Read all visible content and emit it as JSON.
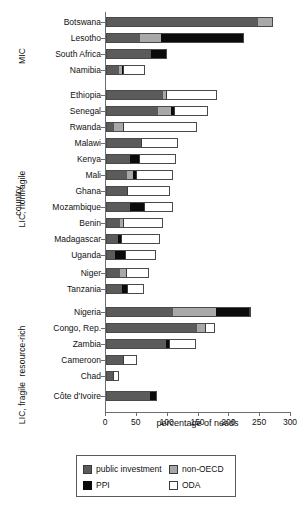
{
  "chart": {
    "type": "bar_stacked_horizontal",
    "xlabel": "percentage of needs",
    "ylabel": "country",
    "xlim": [
      0,
      300
    ],
    "xticks": [
      0,
      50,
      100,
      150,
      200,
      250,
      300
    ],
    "xticklabels": [
      "0",
      "50",
      "100",
      "150",
      "200",
      "250",
      "300"
    ],
    "grid": false,
    "orientation": "horizontal",
    "stacked": true
  },
  "legend": {
    "position": "bottom",
    "entries": [
      {
        "key": "public_investment",
        "label": "public investment",
        "color": "#5b5b5b"
      },
      {
        "key": "non_oecd",
        "label": "non-OECD",
        "color": "#a8a8a8"
      },
      {
        "key": "ppi",
        "label": "PPI",
        "color": "#0b0b0b"
      },
      {
        "key": "oda",
        "label": "ODA",
        "color": "#ffffff"
      }
    ]
  },
  "groups": [
    {
      "key": "mic",
      "label": "MIC"
    },
    {
      "key": "lic_nonfragile",
      "label": "LIC, nonfragile"
    },
    {
      "key": "resource_rich",
      "label": "resource-rich"
    },
    {
      "key": "lic_fragile",
      "label": "LIC, fragile"
    }
  ],
  "chart_data": {
    "type": "bar",
    "title": "",
    "subtitle": "",
    "xlabel": "percentage of needs",
    "ylabel": "country",
    "xlim": [
      0,
      300
    ],
    "ylim": null,
    "grid": false,
    "legend_position": "bottom",
    "stacked": true,
    "orientation": "horizontal",
    "series": [
      {
        "name": "public investment",
        "color": "#5b5b5b",
        "values": [
          246,
          55,
          73,
          21,
          92,
          84,
          13,
          57,
          39,
          34,
          34,
          39,
          23,
          19,
          15,
          23,
          26,
          109,
          147,
          97,
          28,
          11,
          71
        ]
      },
      {
        "name": "non-OECD",
        "color": "#a8a8a8",
        "values": [
          24,
          34,
          0,
          5,
          5,
          21,
          15,
          0,
          0,
          10,
          0,
          0,
          4,
          0,
          0,
          10,
          0,
          70,
          13,
          0,
          0,
          0,
          0
        ]
      },
      {
        "name": "PPI",
        "color": "#0b0b0b",
        "values": [
          0,
          134,
          26,
          2,
          0,
          6,
          0,
          0,
          15,
          5,
          0,
          23,
          0,
          6,
          16,
          0,
          8,
          53,
          0,
          5,
          0,
          0,
          11
        ]
      },
      {
        "name": "ODA",
        "color": "#ffffff",
        "values": [
          0,
          0,
          0,
          36,
          83,
          55,
          120,
          60,
          60,
          60,
          70,
          47,
          65,
          62,
          50,
          36,
          28,
          3,
          16,
          44,
          23,
          10,
          0
        ]
      }
    ],
    "categories": [
      "Botswana",
      "Lesotho",
      "South Africa",
      "Namibia",
      "Ethiopia",
      "Senegal",
      "Rwanda",
      "Malawi",
      "Kenya",
      "Mali",
      "Ghana",
      "Mozambique",
      "Benin",
      "Madagascar",
      "Uganda",
      "Niger",
      "Tanzania",
      "Nigeria",
      "Congo, Rep.",
      "Zambia",
      "Cameroon",
      "Chad",
      "Côte d'Ivoire"
    ],
    "category_groups": [
      "MIC",
      "MIC",
      "MIC",
      "MIC",
      "LIC, nonfragile",
      "LIC, nonfragile",
      "LIC, nonfragile",
      "LIC, nonfragile",
      "LIC, nonfragile",
      "LIC, nonfragile",
      "LIC, nonfragile",
      "LIC, nonfragile",
      "LIC, nonfragile",
      "LIC, nonfragile",
      "LIC, nonfragile",
      "LIC, nonfragile",
      "LIC, nonfragile",
      "resource-rich",
      "resource-rich",
      "resource-rich",
      "resource-rich",
      "resource-rich",
      "LIC, fragile"
    ],
    "totals": [
      270,
      223,
      99,
      64,
      180,
      166,
      148,
      117,
      114,
      109,
      104,
      109,
      92,
      87,
      81,
      69,
      62,
      235,
      176,
      146,
      51,
      21,
      82
    ]
  },
  "bars": [
    {
      "category": "Botswana",
      "y": 17,
      "segments": [
        {
          "k": "public_investment",
          "v": 246
        },
        {
          "k": "non_oecd",
          "v": 24
        }
      ]
    },
    {
      "category": "Lesotho",
      "y": 33,
      "segments": [
        {
          "k": "public_investment",
          "v": 55
        },
        {
          "k": "non_oecd",
          "v": 34
        },
        {
          "k": "ppi",
          "v": 134
        }
      ]
    },
    {
      "category": "South Africa",
      "y": 49,
      "segments": [
        {
          "k": "public_investment",
          "v": 73
        },
        {
          "k": "ppi",
          "v": 26
        }
      ]
    },
    {
      "category": "Namibia",
      "y": 65,
      "segments": [
        {
          "k": "public_investment",
          "v": 21
        },
        {
          "k": "non_oecd",
          "v": 5
        },
        {
          "k": "ppi",
          "v": 2
        },
        {
          "k": "oda",
          "v": 36
        }
      ]
    },
    {
      "category": "Ethiopia",
      "y": 90,
      "segments": [
        {
          "k": "public_investment",
          "v": 92
        },
        {
          "k": "non_oecd",
          "v": 5
        },
        {
          "k": "oda",
          "v": 83
        }
      ]
    },
    {
      "category": "Senegal",
      "y": 106,
      "segments": [
        {
          "k": "public_investment",
          "v": 84
        },
        {
          "k": "non_oecd",
          "v": 21
        },
        {
          "k": "ppi",
          "v": 6
        },
        {
          "k": "oda",
          "v": 55
        }
      ]
    },
    {
      "category": "Rwanda",
      "y": 122,
      "segments": [
        {
          "k": "public_investment",
          "v": 13
        },
        {
          "k": "non_oecd",
          "v": 15
        },
        {
          "k": "oda",
          "v": 120
        }
      ]
    },
    {
      "category": "Malawi",
      "y": 138,
      "segments": [
        {
          "k": "public_investment",
          "v": 57
        },
        {
          "k": "oda",
          "v": 60
        }
      ]
    },
    {
      "category": "Kenya",
      "y": 154,
      "segments": [
        {
          "k": "public_investment",
          "v": 39
        },
        {
          "k": "ppi",
          "v": 15
        },
        {
          "k": "oda",
          "v": 60
        }
      ]
    },
    {
      "category": "Mali",
      "y": 170,
      "segments": [
        {
          "k": "public_investment",
          "v": 34
        },
        {
          "k": "non_oecd",
          "v": 10
        },
        {
          "k": "ppi",
          "v": 5
        },
        {
          "k": "oda",
          "v": 60
        }
      ]
    },
    {
      "category": "Ghana",
      "y": 186,
      "segments": [
        {
          "k": "public_investment",
          "v": 34
        },
        {
          "k": "oda",
          "v": 70
        }
      ]
    },
    {
      "category": "Mozambique",
      "y": 202,
      "segments": [
        {
          "k": "public_investment",
          "v": 39
        },
        {
          "k": "ppi",
          "v": 23
        },
        {
          "k": "oda",
          "v": 47
        }
      ]
    },
    {
      "category": "Benin",
      "y": 218,
      "segments": [
        {
          "k": "public_investment",
          "v": 23
        },
        {
          "k": "non_oecd",
          "v": 4
        },
        {
          "k": "oda",
          "v": 65
        }
      ]
    },
    {
      "category": "Madagascar",
      "y": 234,
      "segments": [
        {
          "k": "public_investment",
          "v": 19
        },
        {
          "k": "ppi",
          "v": 6
        },
        {
          "k": "oda",
          "v": 62
        }
      ]
    },
    {
      "category": "Uganda",
      "y": 250,
      "segments": [
        {
          "k": "public_investment",
          "v": 15
        },
        {
          "k": "ppi",
          "v": 16
        },
        {
          "k": "oda",
          "v": 50
        }
      ]
    },
    {
      "category": "Niger",
      "y": 268,
      "segments": [
        {
          "k": "public_investment",
          "v": 23
        },
        {
          "k": "non_oecd",
          "v": 10
        },
        {
          "k": "oda",
          "v": 36
        }
      ]
    },
    {
      "category": "Tanzania",
      "y": 284,
      "segments": [
        {
          "k": "public_investment",
          "v": 26
        },
        {
          "k": "ppi",
          "v": 8
        },
        {
          "k": "oda",
          "v": 28
        }
      ]
    },
    {
      "category": "Nigeria",
      "y": 307,
      "segments": [
        {
          "k": "public_investment",
          "v": 109
        },
        {
          "k": "non_oecd",
          "v": 70
        },
        {
          "k": "ppi",
          "v": 53
        },
        {
          "k": "oda",
          "v": 3
        }
      ]
    },
    {
      "category": "Congo, Rep.",
      "y": 323,
      "segments": [
        {
          "k": "public_investment",
          "v": 147
        },
        {
          "k": "non_oecd",
          "v": 13
        },
        {
          "k": "oda",
          "v": 16
        }
      ]
    },
    {
      "category": "Zambia",
      "y": 339,
      "segments": [
        {
          "k": "public_investment",
          "v": 97
        },
        {
          "k": "ppi",
          "v": 5
        },
        {
          "k": "oda",
          "v": 44
        }
      ]
    },
    {
      "category": "Cameroon",
      "y": 355,
      "segments": [
        {
          "k": "public_investment",
          "v": 28
        },
        {
          "k": "oda",
          "v": 23
        }
      ]
    },
    {
      "category": "Chad",
      "y": 371,
      "segments": [
        {
          "k": "public_investment",
          "v": 11
        },
        {
          "k": "oda",
          "v": 10
        }
      ]
    },
    {
      "category": "Côte d'Ivoire",
      "y": 391,
      "segments": [
        {
          "k": "public_investment",
          "v": 71
        },
        {
          "k": "ppi",
          "v": 11
        }
      ]
    }
  ],
  "group_positions": [
    {
      "label": "MIC",
      "center_y": 45,
      "height": 70
    },
    {
      "label": "LIC, nonfragile",
      "center_y": 188,
      "height": 210
    },
    {
      "label": "resource-rich",
      "center_y": 340,
      "height": 90
    },
    {
      "label": "LIC, fragile",
      "center_y": 392,
      "height": 60
    }
  ]
}
